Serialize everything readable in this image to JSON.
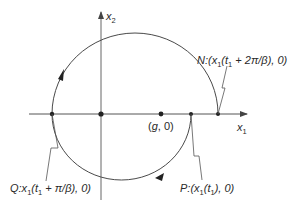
{
  "diagram": {
    "type": "phase-plane trajectory",
    "axes": {
      "x_axis_label": "x",
      "x_axis_sub": "1",
      "y_axis_label": "x",
      "y_axis_sub": "2"
    },
    "points": {
      "origin": {
        "x": 101,
        "y": 114
      },
      "Q": {
        "x": 52,
        "y": 114
      },
      "g": {
        "x": 161,
        "y": 114
      },
      "P": {
        "x": 191,
        "y": 114
      },
      "N": {
        "x": 218,
        "y": 114
      }
    },
    "labels": {
      "N": {
        "name": "N",
        "text": ":(x",
        "sub": "1",
        "rest": "(t",
        "sub2": "1",
        "tail": " + 2π/β), 0)"
      },
      "Q": {
        "name": "Q",
        "text": ":x",
        "sub": "1",
        "rest": "(t",
        "sub2": "1",
        "tail": " + π/β), 0)"
      },
      "P": {
        "name": "P",
        "text": ":(x",
        "sub": "1",
        "rest": "(t",
        "sub2": "1",
        "tail": "), 0)"
      },
      "g": {
        "text_open": "(",
        "name": "g",
        "tail": ", 0)"
      }
    },
    "direction": "clockwise",
    "colors": {
      "line": "#4a4a4a",
      "axis": "#555555",
      "point": "#222222"
    }
  }
}
